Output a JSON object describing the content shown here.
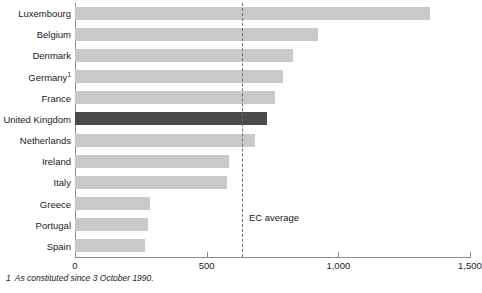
{
  "chart_data": {
    "type": "bar",
    "orientation": "horizontal",
    "title": "",
    "subtitle": "",
    "xlabel": "",
    "ylabel": "",
    "xlim": [
      0,
      1500
    ],
    "grid": false,
    "legend": null,
    "categories": [
      "Luxembourg",
      "Belgium",
      "Denmark",
      "Germany",
      "France",
      "United Kingdom",
      "Netherlands",
      "Ireland",
      "Italy",
      "Greece",
      "Portugal",
      "Spain"
    ],
    "values": [
      1348,
      923,
      828,
      790,
      760,
      729,
      684,
      585,
      577,
      285,
      277,
      266
    ],
    "highlight_category": "United Kingdom",
    "tick_values": [
      0,
      500,
      1000,
      1500
    ],
    "tick_labels": [
      "0",
      "500",
      "1,000",
      "1,500"
    ],
    "annotations": [
      {
        "name": "ec-average",
        "label": "EC average",
        "value": 634,
        "style": "dashed-vertical-line"
      }
    ],
    "footnote_markers": {
      "Germany": "1"
    }
  },
  "colors": {
    "bar": "#c9c9c9",
    "bar_highlight": "#4a4a4a",
    "axis": "#8c8c8c",
    "average_line": "#6b6b6b",
    "text": "#1a1a1a"
  },
  "footnote": {
    "number": "1",
    "text": "As constituted since 3 October 1990."
  }
}
